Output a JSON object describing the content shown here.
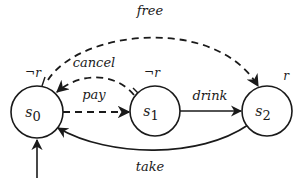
{
  "diagram": {
    "type": "state-transition-diagram",
    "colors": {
      "stroke": "#1a1a1a",
      "background": "#ffffff"
    },
    "states": [
      {
        "id": "s0",
        "name": "s",
        "subscript": "0",
        "label": "¬r",
        "initial": true
      },
      {
        "id": "s1",
        "name": "s",
        "subscript": "1",
        "label": "¬r",
        "initial": false
      },
      {
        "id": "s2",
        "name": "s",
        "subscript": "2",
        "label": "r",
        "initial": false
      }
    ],
    "transitions": [
      {
        "from": "s0",
        "to": "s1",
        "label": "pay",
        "style": "dashed"
      },
      {
        "from": "s1",
        "to": "s0",
        "label": "cancel",
        "style": "dashed"
      },
      {
        "from": "s1",
        "to": "s2",
        "label": "drink",
        "style": "solid"
      },
      {
        "from": "s2",
        "to": "s0",
        "label": "take",
        "style": "solid"
      },
      {
        "from": "s0",
        "to": "s2",
        "label": "free",
        "style": "dashed"
      }
    ]
  }
}
